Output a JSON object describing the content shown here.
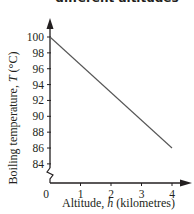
{
  "chart_data": {
    "type": "line",
    "title_visible": "different altitudes",
    "xlabel": "Altitude, h (kilometres)",
    "ylabel": "Boiling temperature, T (°C)",
    "x_ticks": [
      "0",
      "1",
      "2",
      "3",
      "4"
    ],
    "y_ticks": [
      "84",
      "86",
      "88",
      "90",
      "92",
      "94",
      "96",
      "98",
      "100"
    ],
    "xlim": [
      0,
      4.3
    ],
    "ylim": [
      82,
      101
    ],
    "y_axis_break": true,
    "grid": false,
    "legend": null,
    "series": [
      {
        "name": "Boiling temperature",
        "x": [
          0,
          4
        ],
        "y": [
          100,
          86
        ]
      }
    ]
  },
  "labels": {
    "title_line2": "different altitudes",
    "xlabel_prefix": "Altitude, ",
    "xlabel_var": "h",
    "xlabel_suffix": " (kilometres)",
    "ylabel_prefix": "Boiling temperature, ",
    "ylabel_var": "T",
    "ylabel_suffix": " (°C)",
    "origin": "0"
  },
  "colors": {
    "axis": "#231f20",
    "line": "#555555",
    "text": "#231f20"
  }
}
